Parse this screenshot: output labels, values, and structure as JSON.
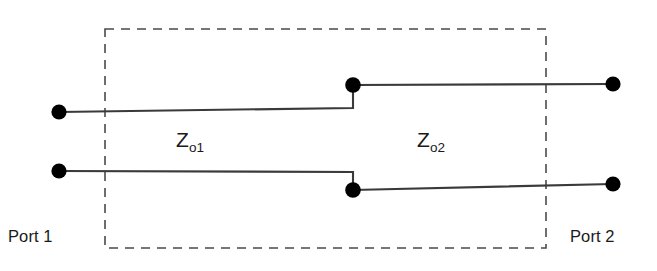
{
  "figure": {
    "type": "circuit-diagram",
    "background_color": "#ffffff",
    "line_color": "#3a3a3a",
    "node_color": "#000000",
    "dashed_box_color": "#444444",
    "text_color": "#1a1a1a"
  },
  "labels": {
    "port_1": "Port 1",
    "port_2": "Port 2",
    "impedance_1_base": "Z",
    "impedance_1_sub": "o1",
    "impedance_2_base": "Z",
    "impedance_2_sub": "o2"
  },
  "geometry": {
    "dashed_box": {
      "x": 105,
      "y": 29,
      "width": 441,
      "height": 219
    },
    "terminals": [
      {
        "name": "port-1-upper",
        "x": 59,
        "y": 112
      },
      {
        "name": "port-1-lower",
        "x": 59,
        "y": 171
      },
      {
        "name": "port-2-upper",
        "x": 613,
        "y": 84
      },
      {
        "name": "port-2-lower",
        "x": 613,
        "y": 184
      }
    ],
    "junction_nodes": [
      {
        "name": "step-junction-upper",
        "x": 353,
        "y": 85
      },
      {
        "name": "step-junction-lower",
        "x": 353,
        "y": 190
      }
    ],
    "node_radius": 7.5,
    "upper_conductor": [
      [
        59,
        112
      ],
      [
        353,
        108
      ],
      [
        353,
        85
      ],
      [
        613,
        84
      ]
    ],
    "lower_conductor": [
      [
        59,
        171
      ],
      [
        353,
        172
      ],
      [
        353,
        190
      ],
      [
        613,
        184
      ]
    ]
  }
}
